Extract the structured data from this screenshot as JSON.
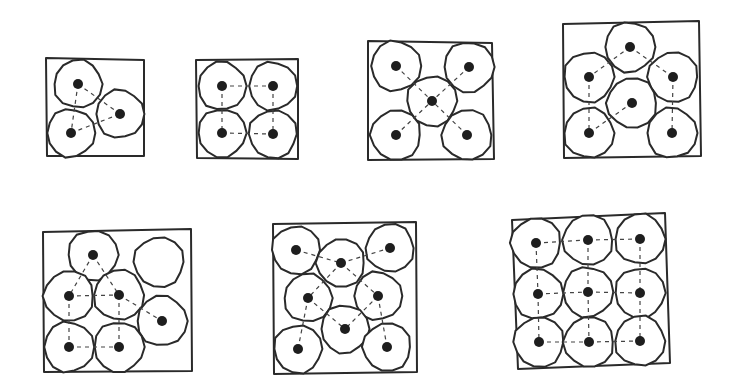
{
  "diagram": {
    "title": "",
    "colors": {
      "stroke": "#2a2a2a",
      "dot": "#1e1e1e",
      "background": "#ffffff"
    },
    "panels": [
      {
        "n": 3,
        "square": [
          [
            46,
            58
          ],
          [
            144,
            60
          ],
          [
            144,
            156
          ],
          [
            47,
            156
          ]
        ],
        "r": 24,
        "circles": [
          [
            78,
            84,
            true
          ],
          [
            120,
            114,
            true
          ],
          [
            71,
            133,
            true
          ]
        ],
        "links": [
          [
            0,
            1
          ],
          [
            0,
            2
          ],
          [
            2,
            1
          ]
        ]
      },
      {
        "n": 4,
        "square": [
          [
            196,
            60
          ],
          [
            298,
            59
          ],
          [
            298,
            159
          ],
          [
            197,
            158
          ]
        ],
        "r": 24,
        "circles": [
          [
            222,
            86,
            true
          ],
          [
            273,
            86,
            true
          ],
          [
            222,
            133,
            true
          ],
          [
            273,
            134,
            true
          ]
        ],
        "links": [
          [
            0,
            1
          ],
          [
            0,
            2
          ],
          [
            1,
            3
          ],
          [
            2,
            3
          ]
        ]
      },
      {
        "n": 5,
        "square": [
          [
            368,
            41
          ],
          [
            492,
            43
          ],
          [
            494,
            159
          ],
          [
            368,
            160
          ]
        ],
        "r": 25,
        "circles": [
          [
            396,
            66,
            true
          ],
          [
            469,
            67,
            true
          ],
          [
            432,
            101,
            true
          ],
          [
            396,
            135,
            true
          ],
          [
            467,
            135,
            true
          ]
        ],
        "links": [
          [
            0,
            2
          ],
          [
            1,
            2
          ],
          [
            3,
            2
          ],
          [
            4,
            2
          ]
        ]
      },
      {
        "n": 6,
        "square": [
          [
            563,
            24
          ],
          [
            699,
            21
          ],
          [
            701,
            156
          ],
          [
            564,
            158
          ]
        ],
        "r": 25,
        "circles": [
          [
            630,
            47,
            true
          ],
          [
            589,
            77,
            true
          ],
          [
            673,
            77,
            true
          ],
          [
            632,
            103,
            true
          ],
          [
            589,
            133,
            true
          ],
          [
            672,
            133,
            true
          ]
        ],
        "links": [
          [
            0,
            1
          ],
          [
            0,
            2
          ],
          [
            1,
            4
          ],
          [
            2,
            5
          ],
          [
            3,
            4
          ]
        ]
      },
      {
        "n": 7,
        "square": [
          [
            43,
            232
          ],
          [
            191,
            229
          ],
          [
            192,
            371
          ],
          [
            44,
            372
          ]
        ],
        "r": 25,
        "circles": [
          [
            93,
            255,
            true
          ],
          [
            159,
            262,
            false
          ],
          [
            69,
            296,
            true
          ],
          [
            119,
            295,
            true
          ],
          [
            162,
            321,
            true
          ],
          [
            69,
            347,
            true
          ],
          [
            119,
            347,
            true
          ]
        ],
        "links": [
          [
            0,
            2
          ],
          [
            0,
            3
          ],
          [
            2,
            3
          ],
          [
            2,
            5
          ],
          [
            3,
            6
          ],
          [
            5,
            6
          ],
          [
            3,
            4
          ]
        ]
      },
      {
        "n": 8,
        "square": [
          [
            273,
            224
          ],
          [
            416,
            222
          ],
          [
            417,
            372
          ],
          [
            274,
            374
          ]
        ],
        "r": 24,
        "circles": [
          [
            296,
            250,
            true
          ],
          [
            341,
            263,
            true
          ],
          [
            390,
            248,
            true
          ],
          [
            308,
            298,
            true
          ],
          [
            378,
            296,
            true
          ],
          [
            345,
            329,
            true
          ],
          [
            298,
            349,
            true
          ],
          [
            387,
            347,
            true
          ]
        ],
        "links": [
          [
            0,
            1
          ],
          [
            1,
            2
          ],
          [
            1,
            3
          ],
          [
            1,
            4
          ],
          [
            3,
            5
          ],
          [
            4,
            5
          ],
          [
            3,
            6
          ],
          [
            4,
            7
          ]
        ]
      },
      {
        "n": 9,
        "square": [
          [
            512,
            220
          ],
          [
            665,
            213
          ],
          [
            670,
            363
          ],
          [
            518,
            369
          ]
        ],
        "r": 25,
        "circles": [
          [
            536,
            243,
            true
          ],
          [
            588,
            240,
            true
          ],
          [
            640,
            239,
            true
          ],
          [
            538,
            294,
            true
          ],
          [
            588,
            292,
            true
          ],
          [
            640,
            293,
            true
          ],
          [
            539,
            342,
            true
          ],
          [
            589,
            342,
            true
          ],
          [
            640,
            341,
            true
          ]
        ],
        "links": [
          [
            0,
            1
          ],
          [
            1,
            2
          ],
          [
            3,
            4
          ],
          [
            4,
            5
          ],
          [
            6,
            7
          ],
          [
            7,
            8
          ],
          [
            0,
            3
          ],
          [
            3,
            6
          ],
          [
            1,
            4
          ],
          [
            4,
            7
          ],
          [
            2,
            5
          ],
          [
            5,
            8
          ]
        ]
      }
    ]
  }
}
